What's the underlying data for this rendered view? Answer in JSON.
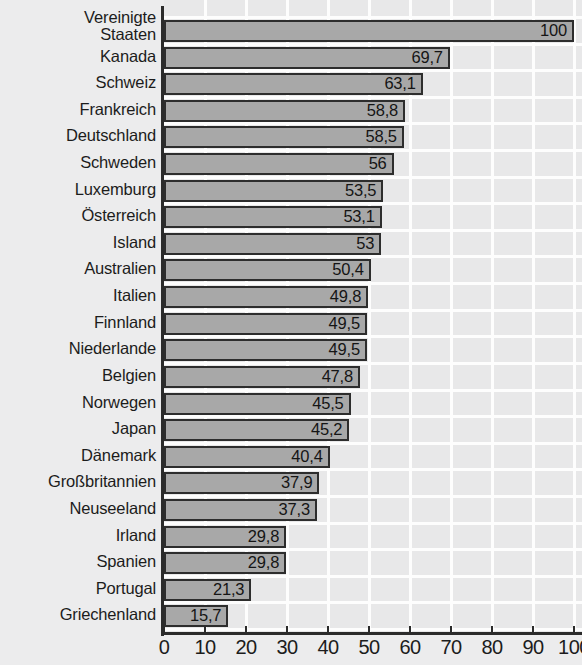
{
  "chart_data": {
    "type": "bar",
    "orientation": "horizontal",
    "title": "",
    "subtitle": "",
    "xlabel": "",
    "ylabel": "",
    "xlim": [
      0,
      100
    ],
    "grid": true,
    "legend": null,
    "decimal_separator": ",",
    "x_ticks": [
      0,
      10,
      20,
      30,
      40,
      50,
      60,
      70,
      80,
      90,
      100
    ],
    "x_tick_labels": [
      "0",
      "10",
      "20",
      "30",
      "40",
      "50",
      "60",
      "70",
      "80",
      "90",
      "100"
    ],
    "categories": [
      "Vereinigte Staaten",
      "Kanada",
      "Schweiz",
      "Frankreich",
      "Deutschland",
      "Schweden",
      "Luxemburg",
      "Österreich",
      "Island",
      "Australien",
      "Italien",
      "Finnland",
      "Niederlande",
      "Belgien",
      "Norwegen",
      "Japan",
      "Dänemark",
      "Großbritannien",
      "Neuseeland",
      "Irland",
      "Spanien",
      "Portugal",
      "Griechenland"
    ],
    "values": [
      100,
      69.7,
      63.1,
      58.8,
      58.5,
      56,
      53.5,
      53.1,
      53,
      50.4,
      49.8,
      49.5,
      49.5,
      47.8,
      45.5,
      45.2,
      40.4,
      37.9,
      37.3,
      29.8,
      29.8,
      21.3,
      15.7
    ],
    "value_labels": [
      "100",
      "69,7",
      "63,1",
      "58,8",
      "58,5",
      "56",
      "53,5",
      "53,1",
      "53",
      "50,4",
      "49,8",
      "49,5",
      "49,5",
      "47,8",
      "45,5",
      "45,2",
      "40,4",
      "37,9",
      "37,3",
      "29,8",
      "29,8",
      "21,3",
      "15,7"
    ],
    "colors": {
      "bar_fill": "#a8a8a8",
      "bar_border": "#2d2d2d",
      "plot_background": "#e8e8e9",
      "page_background": "#ececed",
      "gridline": "#fdfdfd",
      "axis": "#2b2b2b",
      "text": "#1c1c1c"
    }
  },
  "labels": {
    "rows": [
      {
        "line1": "Vereinigte",
        "line2": "Staaten"
      },
      {
        "line1": "Kanada"
      },
      {
        "line1": "Schweiz"
      },
      {
        "line1": "Frankreich"
      },
      {
        "line1": "Deutschland"
      },
      {
        "line1": "Schweden"
      },
      {
        "line1": "Luxemburg"
      },
      {
        "line1": "Österreich"
      },
      {
        "line1": "Island"
      },
      {
        "line1": "Australien"
      },
      {
        "line1": "Italien"
      },
      {
        "line1": "Finnland"
      },
      {
        "line1": "Niederlande"
      },
      {
        "line1": "Belgien"
      },
      {
        "line1": "Norwegen"
      },
      {
        "line1": "Japan"
      },
      {
        "line1": "Dänemark"
      },
      {
        "line1": "Großbritannien"
      },
      {
        "line1": "Neuseeland"
      },
      {
        "line1": "Irland"
      },
      {
        "line1": "Spanien"
      },
      {
        "line1": "Portugal"
      },
      {
        "line1": "Griechenland"
      }
    ]
  }
}
